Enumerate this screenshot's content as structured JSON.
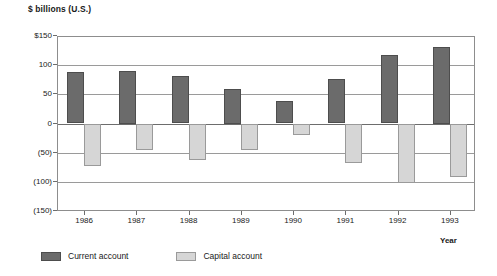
{
  "chart_data": {
    "type": "bar",
    "title": "",
    "ylabel": "$ billions (U.S.)",
    "xlabel": "Year",
    "categories": [
      "1986",
      "1987",
      "1988",
      "1989",
      "1990",
      "1991",
      "1992",
      "1993"
    ],
    "series": [
      {
        "name": "Current account",
        "color": "#6b6b6b",
        "values": [
          88,
          90,
          82,
          60,
          38,
          76,
          118,
          132
        ]
      },
      {
        "name": "Capital account",
        "color": "#d6d6d6",
        "values": [
          -72,
          -45,
          -62,
          -46,
          -20,
          -68,
          -102,
          -92
        ]
      }
    ],
    "ylim": [
      -150,
      150
    ],
    "ytick_labels": [
      "$150",
      "100",
      "50",
      "0",
      "(50)",
      "(100)",
      "(150)"
    ],
    "ytick_values": [
      150,
      100,
      50,
      0,
      -50,
      -100,
      -150
    ],
    "grid": true,
    "legend_position": "bottom-left"
  },
  "legend": {
    "items": [
      {
        "label": "Current account",
        "swatch": "current"
      },
      {
        "label": "Capital account",
        "swatch": "capital"
      }
    ]
  }
}
